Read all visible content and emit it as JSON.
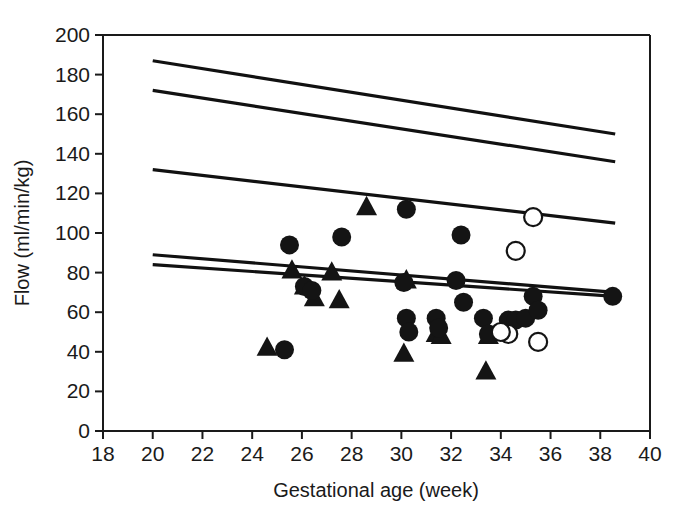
{
  "chart_data": {
    "type": "scatter",
    "title": "",
    "xlabel": "Gestational age (week)",
    "ylabel": "Flow (ml/min/kg)",
    "xlim": [
      18,
      40
    ],
    "ylim": [
      0,
      200
    ],
    "xticks": [
      18,
      20,
      22,
      24,
      26,
      28,
      30,
      32,
      34,
      36,
      38,
      40
    ],
    "yticks": [
      0,
      20,
      40,
      60,
      80,
      100,
      120,
      140,
      160,
      180,
      200
    ],
    "grid": false,
    "legend": "none",
    "series": [
      {
        "name": "filled-circle",
        "marker": "filled circle",
        "points": [
          [
            25.5,
            94
          ],
          [
            25.3,
            41
          ],
          [
            26.1,
            73
          ],
          [
            26.4,
            71
          ],
          [
            27.6,
            98
          ],
          [
            30.2,
            112
          ],
          [
            30.1,
            75
          ],
          [
            30.2,
            57
          ],
          [
            30.3,
            50
          ],
          [
            31.4,
            57
          ],
          [
            31.5,
            52
          ],
          [
            32.4,
            99
          ],
          [
            32.2,
            76
          ],
          [
            32.5,
            65
          ],
          [
            33.3,
            57
          ],
          [
            33.5,
            49
          ],
          [
            34.3,
            56
          ],
          [
            34.6,
            56
          ],
          [
            35.0,
            57
          ],
          [
            35.3,
            68
          ],
          [
            35.5,
            61
          ],
          [
            38.5,
            68
          ]
        ]
      },
      {
        "name": "open-circle",
        "marker": "open circle",
        "points": [
          [
            35.3,
            108
          ],
          [
            34.6,
            91
          ],
          [
            34.3,
            49
          ],
          [
            34.0,
            50
          ],
          [
            35.5,
            45
          ]
        ]
      },
      {
        "name": "filled-triangle",
        "marker": "filled triangle",
        "points": [
          [
            24.6,
            42
          ],
          [
            25.6,
            81
          ],
          [
            26.1,
            73
          ],
          [
            26.5,
            67
          ],
          [
            27.2,
            80
          ],
          [
            27.5,
            66
          ],
          [
            28.6,
            113
          ],
          [
            30.2,
            76
          ],
          [
            30.1,
            39
          ],
          [
            31.4,
            49
          ],
          [
            31.6,
            48
          ],
          [
            33.4,
            30
          ],
          [
            33.5,
            48
          ]
        ]
      }
    ],
    "reference_lines": [
      {
        "name": "upper-outer",
        "x": [
          20,
          38.6
        ],
        "y": [
          187,
          150
        ]
      },
      {
        "name": "upper-inner",
        "x": [
          20,
          38.6
        ],
        "y": [
          172,
          136
        ]
      },
      {
        "name": "middle",
        "x": [
          20,
          38.6
        ],
        "y": [
          132,
          105
        ]
      },
      {
        "name": "lower-upper",
        "x": [
          20,
          38.6
        ],
        "y": [
          89,
          70
        ]
      },
      {
        "name": "lower-lower",
        "x": [
          20,
          38.6
        ],
        "y": [
          84,
          68
        ]
      }
    ]
  }
}
